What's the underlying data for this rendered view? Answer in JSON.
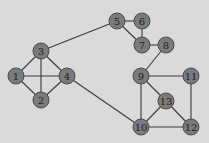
{
  "colors": {
    "background": "#dadada",
    "node_fill": "#7b7b7b",
    "node_stroke": "#4a4a4a",
    "edge": "#3a3a3a",
    "label": "#1e1e1e"
  },
  "node_radius": 8,
  "nodes": [
    {
      "id": "1",
      "label": "1",
      "x": 16,
      "y": 76
    },
    {
      "id": "2",
      "label": "2",
      "x": 41,
      "y": 100
    },
    {
      "id": "3",
      "label": "3",
      "x": 41,
      "y": 51
    },
    {
      "id": "4",
      "label": "4",
      "x": 67,
      "y": 76
    },
    {
      "id": "5",
      "label": "5",
      "x": 117,
      "y": 21
    },
    {
      "id": "6",
      "label": "6",
      "x": 142,
      "y": 21
    },
    {
      "id": "7",
      "label": "7",
      "x": 142,
      "y": 45
    },
    {
      "id": "8",
      "label": "8",
      "x": 166,
      "y": 45
    },
    {
      "id": "9",
      "label": "9",
      "x": 141,
      "y": 76
    },
    {
      "id": "10",
      "label": "10",
      "x": 141,
      "y": 127
    },
    {
      "id": "11",
      "label": "11",
      "x": 191,
      "y": 76
    },
    {
      "id": "12",
      "label": "12",
      "x": 191,
      "y": 127
    },
    {
      "id": "13",
      "label": "13",
      "x": 166,
      "y": 101
    }
  ],
  "edges": [
    [
      "1",
      "2"
    ],
    [
      "1",
      "3"
    ],
    [
      "1",
      "4"
    ],
    [
      "2",
      "3"
    ],
    [
      "2",
      "4"
    ],
    [
      "3",
      "4"
    ],
    [
      "3",
      "5"
    ],
    [
      "5",
      "6"
    ],
    [
      "5",
      "7"
    ],
    [
      "6",
      "7"
    ],
    [
      "7",
      "8"
    ],
    [
      "8",
      "9"
    ],
    [
      "4",
      "10"
    ],
    [
      "9",
      "10"
    ],
    [
      "9",
      "11"
    ],
    [
      "9",
      "13"
    ],
    [
      "11",
      "12"
    ],
    [
      "10",
      "13"
    ],
    [
      "12",
      "13"
    ],
    [
      "10",
      "12"
    ]
  ]
}
